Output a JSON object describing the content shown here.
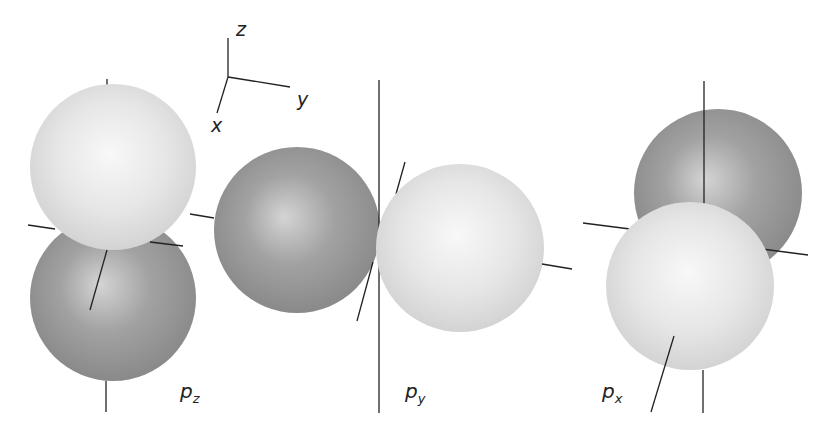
{
  "diagram": {
    "colors": {
      "background": "#ffffff",
      "axis": "#222222",
      "light_lobe": "#e4e4e4",
      "light_lobe_highlight": "#f7f7f7",
      "dark_lobe": "#8f8f8f",
      "dark_lobe_highlight": "#d6d6d6"
    },
    "coordinate_triad": {
      "labels": {
        "z": "z",
        "y": "y",
        "x": "x"
      }
    },
    "orbitals": [
      {
        "id": "pz",
        "base": "p",
        "subscript": "z",
        "axis": "vertical"
      },
      {
        "id": "py",
        "base": "p",
        "subscript": "y",
        "axis": "horizontal"
      },
      {
        "id": "px",
        "base": "p",
        "subscript": "x",
        "axis": "depth"
      }
    ]
  }
}
